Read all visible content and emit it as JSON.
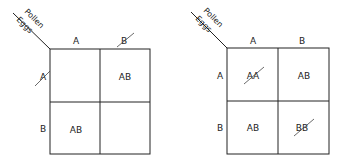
{
  "left_square": {
    "corner": {
      "top_label": "Pollen",
      "bottom_label": "Eggs"
    },
    "column_headers": [
      "A",
      "B"
    ],
    "row_headers": [
      "A",
      "B"
    ],
    "crossed_out_headers": {
      "column": "B",
      "row": "A"
    },
    "cells": [
      [
        "",
        "AB"
      ],
      [
        "AB",
        ""
      ]
    ]
  },
  "right_square": {
    "corner": {
      "top_label": "Pollen",
      "bottom_label": "Eggs"
    },
    "column_headers": [
      "A",
      "B"
    ],
    "row_headers": [
      "A",
      "B"
    ],
    "cells": [
      [
        "AA",
        "AB"
      ],
      [
        "AB",
        "BB"
      ]
    ],
    "crossed_out_cells": [
      "AA",
      "BB"
    ]
  }
}
